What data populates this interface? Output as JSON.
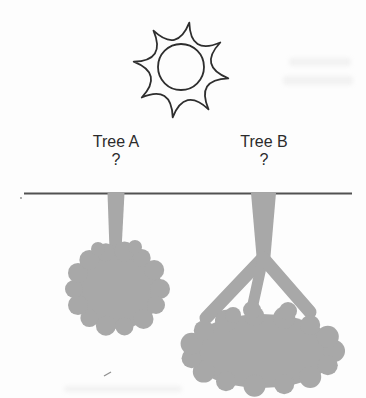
{
  "figure": {
    "colors": {
      "bg": "#fdfdfd",
      "gray": "#a8a8a8",
      "outline": "#2e2e2e",
      "ground": "#515151",
      "text": "#2b2b2b"
    },
    "icons": {
      "sun": "sun-outline-icon"
    },
    "trees": [
      {
        "id": "tree-a",
        "label": "Tree A",
        "question": "?"
      },
      {
        "id": "tree-b",
        "label": "Tree B",
        "question": "?"
      }
    ]
  }
}
